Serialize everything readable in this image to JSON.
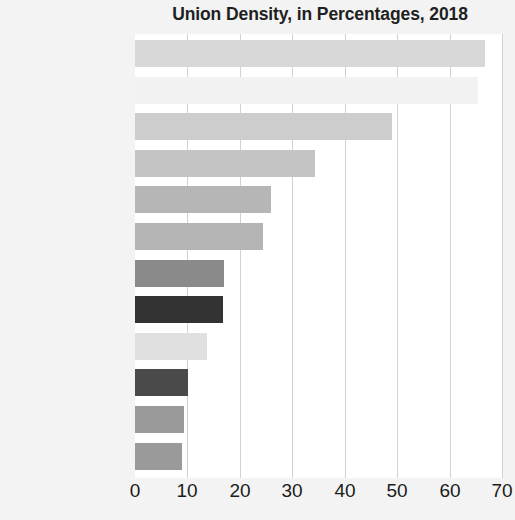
{
  "chart_data": {
    "type": "bar",
    "orientation": "horizontal",
    "title": "Union Density, in Percentages, 2018",
    "xlabel": "",
    "ylabel": "",
    "xlim": [
      0,
      70
    ],
    "xticks": [
      0,
      10,
      20,
      30,
      40,
      50,
      60,
      70
    ],
    "xtick_labels": [
      "0",
      "10",
      "20",
      "30",
      "40",
      "50",
      "60",
      "70"
    ],
    "grid": true,
    "legend": "none",
    "categories": [
      "Denmark",
      "Sweden",
      "Norway",
      "Italy",
      "Canada",
      "Ireland",
      "Japan",
      "Germany",
      "Australia",
      "United States",
      "Turkey",
      "France"
    ],
    "values": [
      66.7,
      65.5,
      49.0,
      34.4,
      25.9,
      24.5,
      17.0,
      16.7,
      13.7,
      10.1,
      9.4,
      8.9
    ],
    "bar_colors": [
      "#d8d8d8",
      "#f2f2f2",
      "#cdcdcd",
      "#c4c4c4",
      "#b6b6b6",
      "#b4b4b4",
      "#8a8a8a",
      "#333333",
      "#e0e0e0",
      "#4a4a4a",
      "#9a9a9a",
      "#9a9a9a"
    ],
    "series": [
      {
        "name": "Union Density 2018",
        "values": [
          66.7,
          65.5,
          49.0,
          34.4,
          25.9,
          24.5,
          17.0,
          16.7,
          13.7,
          10.1,
          9.4,
          8.9
        ]
      }
    ],
    "background_color": "#f3f3f3",
    "plot_background_color": "#ffffff",
    "gridline_color": "#d2d2d2",
    "text_color": "#1b1b1b"
  }
}
